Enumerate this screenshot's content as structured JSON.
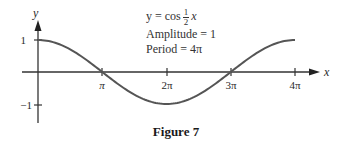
{
  "chart_data": {
    "type": "line",
    "title": "",
    "function": "y = cos(x/2)",
    "xlabel": "x",
    "ylabel": "y",
    "xlim": [
      0,
      12.566
    ],
    "ylim": [
      -1,
      1
    ],
    "x_ticks": [
      {
        "value": 3.1416,
        "label": "π"
      },
      {
        "value": 6.2832,
        "label": "2π"
      },
      {
        "value": 9.4248,
        "label": "3π"
      },
      {
        "value": 12.5664,
        "label": "4π"
      }
    ],
    "y_ticks": [
      {
        "value": 1,
        "label": "1"
      },
      {
        "value": -1,
        "label": "−1"
      }
    ],
    "series": [
      {
        "name": "y = cos ½x",
        "x": [
          0,
          1.5708,
          3.1416,
          4.7124,
          6.2832,
          7.854,
          9.4248,
          10.9956,
          12.5664
        ],
        "values": [
          1,
          0.7071,
          0,
          -0.7071,
          -1,
          -0.7071,
          0,
          0.7071,
          1
        ]
      }
    ],
    "annotations": [
      "y = cos ½x",
      "Amplitude = 1",
      "Period = 4π"
    ],
    "grid": false,
    "legend": null
  },
  "annotation": {
    "eq_prefix": "y = cos",
    "eq_num": "1",
    "eq_den": "2",
    "eq_var": "x",
    "amplitude": "Amplitude = 1",
    "period": "Period = 4π"
  },
  "axes": {
    "x_label": "x",
    "y_label": "y",
    "x_tick_labels": [
      "π",
      "2π",
      "3π",
      "4π"
    ],
    "y_tick_labels": [
      "1",
      "−1"
    ]
  },
  "caption": "Figure 7"
}
